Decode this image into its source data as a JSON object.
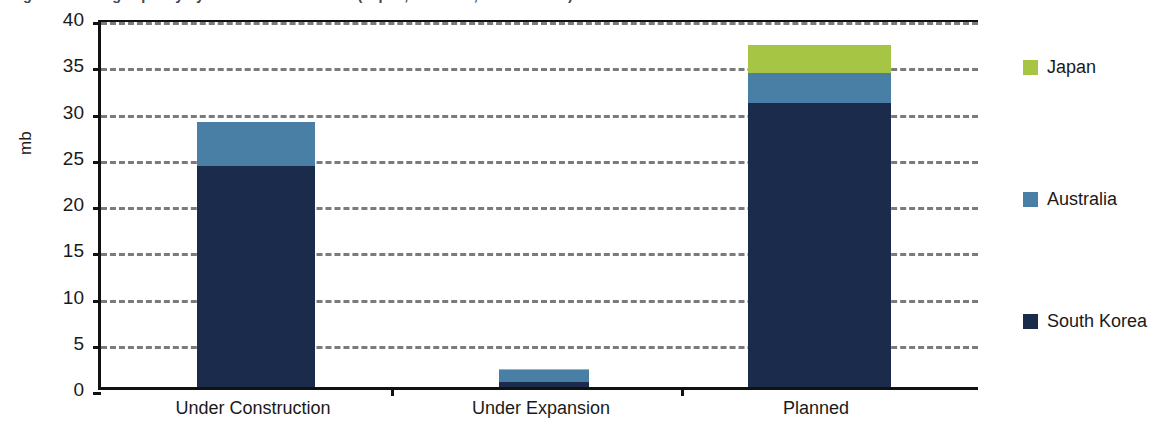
{
  "chart_data": {
    "type": "bar",
    "title": "Figure: Refining capacity by status in Asia-Pacific (Japan, Australia, South Korea)",
    "subtitle": "",
    "xlabel": "",
    "ylabel": "mb",
    "ylim": [
      0,
      40
    ],
    "ytick_step": 5,
    "yticks": [
      "40",
      "35",
      "30",
      "25",
      "20",
      "15",
      "10",
      "5",
      "0"
    ],
    "grid": true,
    "grid_style": "dashed-horizontal",
    "stacked": true,
    "legend_position": "right",
    "categories": [
      "Under Construction",
      "Under Expansion",
      "Planned"
    ],
    "series": [
      {
        "name": "South Korea",
        "color": "#1b2b4b",
        "values": [
          23.9,
          0.5,
          30.7
        ]
      },
      {
        "name": "Australia",
        "color": "#4a7fa5",
        "values": [
          4.8,
          1.3,
          3.3
        ]
      },
      {
        "name": "Japan",
        "color": "#a6c544",
        "values": [
          0,
          0.2,
          3.0
        ]
      }
    ],
    "totals": [
      28.7,
      2.0,
      37.0
    ]
  },
  "legend": {
    "items": [
      {
        "label": "Japan",
        "color": "#a6c544"
      },
      {
        "label": "Australia",
        "color": "#4a7fa5"
      },
      {
        "label": "South Korea",
        "color": "#1b2b4b"
      }
    ]
  },
  "axis": {
    "y_title": "mb"
  },
  "colors": {
    "south_korea": "#1b2b4b",
    "australia": "#4a7fa5",
    "japan": "#a6c544",
    "gridline": "#7b7b7b",
    "axis": "#111111"
  }
}
